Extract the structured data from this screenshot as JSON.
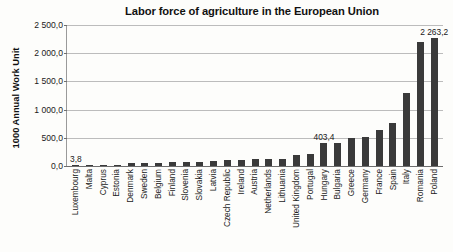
{
  "chart_data": {
    "type": "bar",
    "title": "Labor force of agriculture in the European Union",
    "xlabel": "",
    "ylabel": "1000 Annual Work Unit",
    "ylim": [
      0,
      2500
    ],
    "grid": true,
    "legend": "none",
    "ytick_labels": [
      "2 500,0",
      "2 000,0",
      "1 500,0",
      "1 000,0",
      "500,0",
      "0,0"
    ],
    "ytick_values": [
      2500,
      2000,
      1500,
      1000,
      500,
      0
    ],
    "categories": [
      "Luxembourg",
      "Malta",
      "Cyprus",
      "Estonia",
      "Denmark",
      "Sweden",
      "Belgium",
      "Finland",
      "Slovenia",
      "Slovakia",
      "Latvia",
      "Czech Republic",
      "Ireland",
      "Austria",
      "Netherlands",
      "Lithuania",
      "United Kingdom",
      "Portugal",
      "Hungary",
      "Bulgaria",
      "Greece",
      "Germany",
      "France",
      "Spain",
      "Italy",
      "Romania",
      "Poland"
    ],
    "values": [
      3.8,
      5.0,
      18.0,
      22.0,
      50.0,
      58.0,
      62.0,
      68.0,
      78.0,
      80.0,
      88.0,
      105.0,
      115.0,
      118.0,
      120.0,
      128.0,
      196.0,
      212.0,
      403.4,
      400.0,
      493.0,
      522.0,
      640.0,
      755.0,
      1300.0,
      2200.0,
      2263.2
    ],
    "data_labels": [
      {
        "category": "Luxembourg",
        "text": "3,8"
      },
      {
        "category": "Hungary",
        "text": "403,4"
      },
      {
        "category": "Poland",
        "text": "2 263,2"
      }
    ],
    "bar_color": "#3a3a3a",
    "gridline_color": "#bcbcbc",
    "axis_color": "#6e6e6e",
    "background_color": "#fdfdfb"
  },
  "caption": {
    "text": ""
  }
}
